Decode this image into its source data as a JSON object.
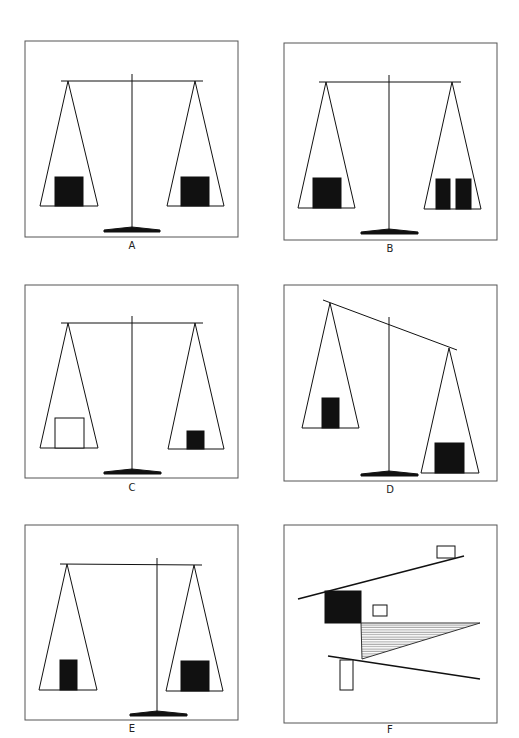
{
  "figure": {
    "panels": [
      {
        "id": "A",
        "label": "A",
        "description": "Balanced scale, one equal black block on each pan"
      },
      {
        "id": "B",
        "label": "B",
        "description": "Balanced scale, one black block on left pan, two narrow black blocks on right pan"
      },
      {
        "id": "C",
        "label": "C",
        "description": "Balanced scale, large hollow block on left pan, small black block on right pan"
      },
      {
        "id": "D",
        "label": "D",
        "description": "Tilted scale, small block on raised left pan, large block on lowered right pan"
      },
      {
        "id": "E",
        "label": "E",
        "description": "Balanced beam with off-center post, narrow block left, larger block right"
      },
      {
        "id": "F",
        "label": "F",
        "description": "Abstract composition of lines, rectangles, black square and hatched triangle"
      }
    ]
  },
  "colors": {
    "ink": "#111111",
    "paper": "#ffffff",
    "frame": "#555555",
    "hatch": "#777777"
  }
}
